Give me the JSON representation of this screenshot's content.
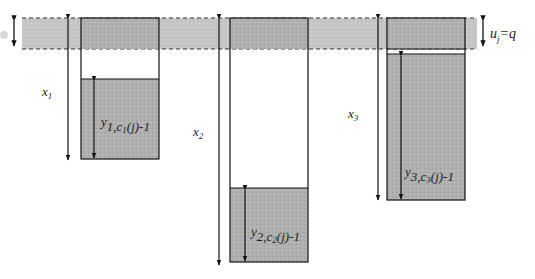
{
  "diagram": {
    "band_label": {
      "main": "u",
      "sub": "j",
      "rest": "=q"
    },
    "columns": [
      {
        "x_label": {
          "main": "x",
          "sub": "1"
        },
        "y_label": {
          "main": "y",
          "sub": "1,c",
          "sub2": "1",
          "tail": "(j)-1"
        }
      },
      {
        "x_label": {
          "main": "x",
          "sub": "2"
        },
        "y_label": {
          "main": "y",
          "sub": "2,c",
          "sub2": "2",
          "tail": "(j)-1"
        }
      },
      {
        "x_label": {
          "main": "x",
          "sub": "3"
        },
        "y_label": {
          "main": "y",
          "sub": "3,c",
          "sub2": "3",
          "tail": "(j)-1"
        }
      }
    ],
    "colors": {
      "fill": "#a9a9a9",
      "band": "#c4c4c4",
      "line": "#1a1a1a"
    }
  }
}
